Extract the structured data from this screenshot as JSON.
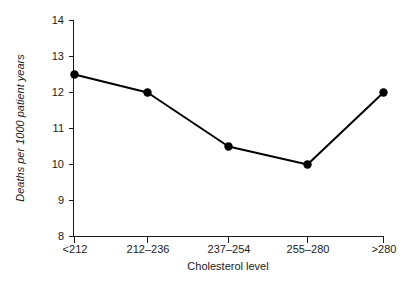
{
  "chart_data": {
    "type": "line",
    "title": "",
    "xlabel": "Cholesterol level",
    "ylabel": "Deaths per 1000 patient years",
    "categories": [
      "<212",
      "212–236",
      "237–254",
      "255–280",
      ">280"
    ],
    "values": [
      12.5,
      12.0,
      10.5,
      10.0,
      12.0
    ],
    "series": [
      {
        "name": "Deaths per 1000 patient years",
        "values": [
          12.5,
          12.0,
          10.5,
          10.0,
          12.0
        ]
      }
    ],
    "ylim": [
      8,
      14
    ],
    "yticks": [
      8,
      9,
      10,
      11,
      12,
      13,
      14
    ],
    "ytick_labels": [
      "8",
      "9",
      "10",
      "11",
      "12",
      "13",
      "14"
    ],
    "grid": false,
    "legend": "none",
    "marker": "filled-circle",
    "line_color": "#000000",
    "marker_color": "#000000",
    "axis_color": "#1a1a1a",
    "background_color": "#ffffff"
  },
  "labels": {
    "y_axis_title": "Deaths per 1000 patient years",
    "x_axis_title": "Cholesterol level"
  }
}
